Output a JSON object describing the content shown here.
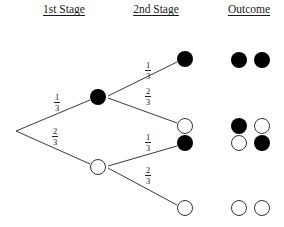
{
  "headers": {
    "stage1": "1st Stage",
    "stage2": "2nd Stage",
    "outcome": "Outcome"
  },
  "colors": {
    "line": "#3a3a3a",
    "filled": "#000000",
    "empty_stroke": "#333333",
    "empty_fill": "#ffffff"
  },
  "tree": {
    "root": {
      "x": 16,
      "y": 131
    },
    "stage1": [
      {
        "id": "s1-black",
        "x": 98,
        "y": 97,
        "fill": "black",
        "prob": {
          "num": "1",
          "den": "3"
        }
      },
      {
        "id": "s1-white",
        "x": 98,
        "y": 167,
        "fill": "white",
        "prob": {
          "num": "2",
          "den": "3"
        }
      }
    ],
    "stage2": [
      {
        "parent": "s1-black",
        "x": 185,
        "y": 59,
        "fill": "black",
        "prob": {
          "num": "1",
          "den": "3"
        }
      },
      {
        "parent": "s1-black",
        "x": 185,
        "y": 126,
        "fill": "white",
        "prob": {
          "num": "2",
          "den": "3"
        }
      },
      {
        "parent": "s1-white",
        "x": 185,
        "y": 143,
        "fill": "black",
        "prob": {
          "num": "1",
          "den": "3"
        }
      },
      {
        "parent": "s1-white",
        "x": 185,
        "y": 208,
        "fill": "white",
        "prob": {
          "num": "2",
          "den": "3"
        }
      }
    ],
    "outcomes": [
      {
        "y": 60,
        "balls": [
          "black",
          "black"
        ]
      },
      {
        "y": 126,
        "balls": [
          "black",
          "white"
        ]
      },
      {
        "y": 143,
        "balls": [
          "white",
          "black"
        ]
      },
      {
        "y": 208,
        "balls": [
          "white",
          "white"
        ]
      }
    ]
  },
  "labels": {
    "s1_top": {
      "num": "1",
      "den": "3"
    },
    "s1_bottom": {
      "num": "2",
      "den": "3"
    },
    "s2_top_upper": {
      "num": "1",
      "den": "3"
    },
    "s2_top_lower": {
      "num": "2",
      "den": "3"
    },
    "s2_bottom_upper": {
      "num": "1",
      "den": "3"
    },
    "s2_bottom_lower": {
      "num": "2",
      "den": "3"
    }
  }
}
